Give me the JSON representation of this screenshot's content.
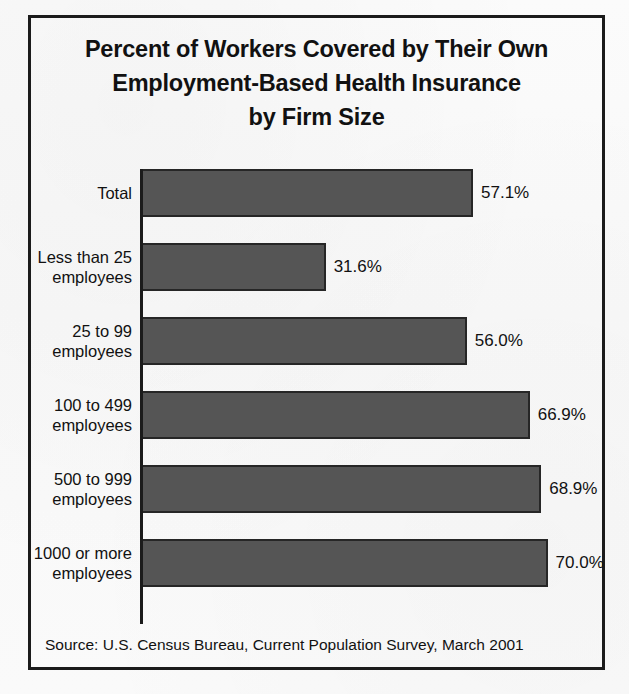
{
  "figure": {
    "title_lines": [
      "Percent of Workers Covered by Their Own",
      "Employment-Based Health Insurance",
      "by Firm Size"
    ],
    "source": "Source: U.S. Census Bureau, Current Population Survey, March 2001",
    "bar_color": "#555555",
    "bar_edge_color": "#262626",
    "border_color": "#1b1b1b",
    "background_color": "#f9f9f9"
  },
  "chart_data": {
    "type": "bar",
    "orientation": "horizontal",
    "title": "Percent of Workers Covered by Their Own Employment-Based Health Insurance by Firm Size",
    "xlabel": "",
    "ylabel": "",
    "xlim": [
      0,
      78
    ],
    "grid": false,
    "legend": false,
    "value_suffix": "%",
    "categories": [
      "Total",
      "Less than 25 employees",
      "25 to 99 employees",
      "100 to 499 employees",
      "500 to 999 employees",
      "1000 or more employees"
    ],
    "category_label_lines": [
      [
        "Total"
      ],
      [
        "Less than 25",
        "employees"
      ],
      [
        "25 to 99",
        "employees"
      ],
      [
        "100 to 499",
        "employees"
      ],
      [
        "500 to 999",
        "employees"
      ],
      [
        "1000 or more",
        "employees"
      ]
    ],
    "values": [
      57.1,
      31.6,
      56.0,
      66.9,
      68.9,
      70.0
    ],
    "value_labels": [
      "57.1%",
      "31.6%",
      "56.0%",
      "66.9%",
      "68.9%",
      "70.0%"
    ],
    "source": "Source: U.S. Census Bureau, Current Population Survey, March 2001"
  }
}
